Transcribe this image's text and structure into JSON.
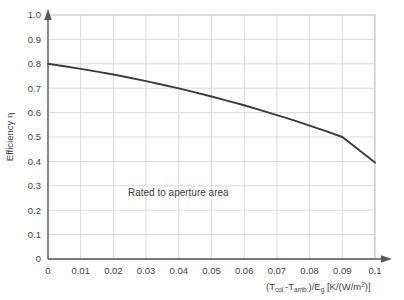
{
  "chart_data": {
    "type": "line",
    "title": "",
    "xlabel": "(T_col-T_amb.)/E_g [K/(W/m²)]",
    "ylabel": "Efficiency η",
    "xlim": [
      0,
      0.1
    ],
    "ylim": [
      0,
      1.0
    ],
    "grid": true,
    "legend": null,
    "annotations": [
      {
        "text": "Rated to aperture area",
        "x": 0.029,
        "y": 0.255
      }
    ],
    "xticks": [
      "0",
      "0.01",
      "0.02",
      "0.03",
      "0.04",
      "0.05",
      "0.06",
      "0.07",
      "0.08",
      "0.09",
      "0.1"
    ],
    "xtick_values": [
      0,
      0.01,
      0.02,
      0.03,
      0.04,
      0.05,
      0.06,
      0.07,
      0.08,
      0.09,
      0.1
    ],
    "yticks": [
      "0",
      "0.1",
      "0.2",
      "0.3",
      "0.4",
      "0.5",
      "0.6",
      "0.7",
      "0.8",
      "0.9",
      "1.0"
    ],
    "ytick_values": [
      0,
      0.1,
      0.2,
      0.3,
      0.4,
      0.5,
      0.6,
      0.7,
      0.8,
      0.9,
      1.0
    ],
    "series": [
      {
        "name": "Collector efficiency",
        "color": "#3b3b3b",
        "x": [
          0,
          0.005,
          0.01,
          0.015,
          0.02,
          0.025,
          0.03,
          0.035,
          0.04,
          0.045,
          0.05,
          0.055,
          0.06,
          0.065,
          0.07,
          0.075,
          0.08,
          0.085,
          0.09,
          0.095,
          0.1
        ],
        "y": [
          0.8,
          0.79,
          0.779,
          0.768,
          0.756,
          0.743,
          0.729,
          0.714,
          0.699,
          0.683,
          0.666,
          0.648,
          0.63,
          0.61,
          0.59,
          0.569,
          0.547,
          0.524,
          0.5,
          0.448,
          0.395
        ]
      }
    ]
  },
  "axis_label_parts": {
    "x_open": "(T",
    "x_sub1": "col.",
    "x_dash": "-T",
    "x_sub2": "amb.",
    "x_close": ")/E",
    "x_sub3": "g",
    "x_units_open": " [K/(W/m",
    "x_units_sup": "2",
    "x_units_close": ")]",
    "y_text": "Efficiency η"
  },
  "style": {
    "curve_color": "#3b3b3b",
    "axis_color": "#595959",
    "grid_color": "#d9d9d9",
    "plot_border_color": "#bfbfbf",
    "background": "#ffffff",
    "text_color": "#3f3f3f"
  }
}
